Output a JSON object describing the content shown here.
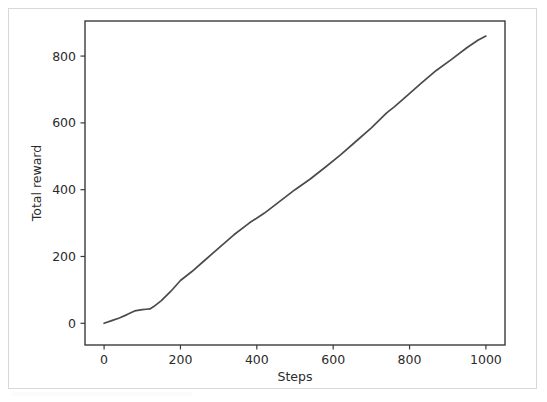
{
  "figure": {
    "background_color": "#ffffff",
    "border_color": "#d8d8d8",
    "line_color": "#4b4b4b",
    "axis_color": "#3a3a3a",
    "text_color": "#2b2b2b"
  },
  "chart_data": {
    "type": "line",
    "title": "",
    "xlabel": "Steps",
    "ylabel": "Total reward",
    "xlim": [
      -50,
      1050
    ],
    "ylim": [
      -65,
      905
    ],
    "xticks": [
      0,
      200,
      400,
      600,
      800,
      1000
    ],
    "yticks": [
      0,
      200,
      400,
      600,
      800
    ],
    "xtick_labels": [
      "0",
      "200",
      "400",
      "600",
      "800",
      "1000"
    ],
    "ytick_labels": [
      "0",
      "200",
      "400",
      "600",
      "800"
    ],
    "grid": false,
    "legend": null,
    "series": [
      {
        "name": "Total reward",
        "color": "#4b4b4b",
        "x": [
          0,
          20,
          40,
          60,
          80,
          100,
          110,
          120,
          130,
          150,
          175,
          200,
          230,
          260,
          300,
          340,
          380,
          420,
          460,
          500,
          540,
          580,
          620,
          660,
          700,
          740,
          760,
          790,
          830,
          870,
          910,
          950,
          980,
          1000
        ],
        "y": [
          0,
          8,
          16,
          26,
          37,
          41,
          42,
          43,
          50,
          68,
          96,
          128,
          155,
          185,
          225,
          265,
          300,
          330,
          365,
          400,
          432,
          468,
          505,
          545,
          585,
          630,
          648,
          678,
          718,
          757,
          790,
          825,
          848,
          860
        ]
      }
    ]
  }
}
